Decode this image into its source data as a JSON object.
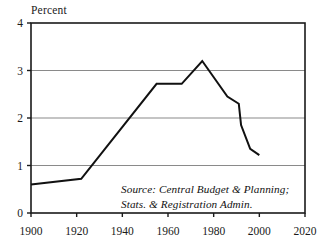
{
  "chart_data": {
    "type": "line",
    "title": "",
    "subtitle": "",
    "xlabel": "",
    "ylabel": "Percent",
    "xlim": [
      1900,
      2020
    ],
    "ylim": [
      0,
      4
    ],
    "xticks": [
      1900,
      1920,
      1940,
      1960,
      1980,
      2000,
      2020
    ],
    "yticks": [
      0,
      1,
      2,
      3,
      4
    ],
    "xtick_labels": [
      "1900",
      "1920",
      "1940",
      "1960",
      "1980",
      "2000",
      "2020"
    ],
    "ytick_labels": [
      "0",
      "1",
      "2",
      "3",
      "4"
    ],
    "grid": "horizontal",
    "legend": "none",
    "series": [
      {
        "name": "Percent",
        "color": "#111111",
        "x": [
          1900,
          1922,
          1955,
          1966,
          1975,
          1986,
          1991,
          1992,
          1996,
          2000
        ],
        "values": [
          0.6,
          0.72,
          2.72,
          2.72,
          3.2,
          2.45,
          2.3,
          1.85,
          1.35,
          1.22
        ]
      }
    ],
    "annotations": [
      "Source: Central Budget & Planning;",
      "Stats. & Registration Admin."
    ]
  },
  "axis_title": "Percent",
  "source": {
    "line1": "Source: Central Budget & Planning;",
    "line2": "Stats. & Registration Admin."
  },
  "colors": {
    "line": "#111111",
    "grid": "#8a8a8a",
    "frame": "#1a1a1a",
    "background": "#ffffff",
    "text": "#1a1a1a"
  }
}
